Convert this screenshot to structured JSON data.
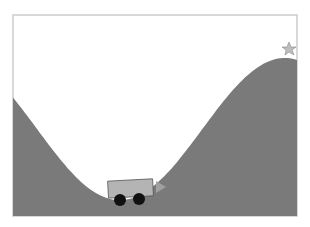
{
  "environment": {
    "name": "MountainCar",
    "x_range": [
      -1.2,
      0.6
    ],
    "goal_position": 0.5,
    "car_position": -0.5,
    "car_angle_deg": -3
  },
  "colors": {
    "background": "#ffffff",
    "frame": "#c8c8c8",
    "terrain": "#7a7a7a",
    "car_body": "#b4b4b4",
    "car_outline": "#555555",
    "wheel": "#111111",
    "flag": "#9a9a9a",
    "goal_star": "#b0b0b0"
  },
  "icons": {
    "goal": "star-icon",
    "direction": "triangle-right-icon"
  }
}
